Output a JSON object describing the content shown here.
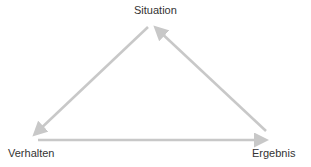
{
  "diagram": {
    "nodes": {
      "situation": "Situation",
      "verhalten": "Verhalten",
      "ergebnis": "Ergebnis"
    },
    "edges": [
      {
        "from": "Situation",
        "to": "Verhalten"
      },
      {
        "from": "Verhalten",
        "to": "Ergebnis"
      },
      {
        "from": "Ergebnis",
        "to": "Situation"
      }
    ],
    "arrow_color": "#c8c8c8",
    "text_color": "#333333"
  }
}
